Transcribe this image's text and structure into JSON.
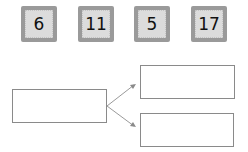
{
  "cards": [
    {
      "value": "6"
    },
    {
      "value": "11"
    },
    {
      "value": "5"
    },
    {
      "value": "17"
    }
  ],
  "diagram": {
    "source_box": {
      "text": ""
    },
    "target_boxes": [
      {
        "text": ""
      },
      {
        "text": ""
      }
    ]
  }
}
